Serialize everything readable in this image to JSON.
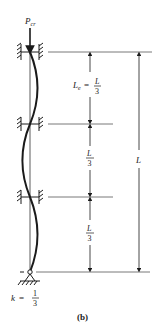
{
  "diagram": {
    "caption": "(b)",
    "load_label": "P",
    "load_subscript": "cr",
    "effective_length_label": {
      "symbol": "L",
      "subscript": "e",
      "equals": "=",
      "numerator": "L",
      "denominator": "3"
    },
    "segment_labels": [
      {
        "numerator": "L",
        "denominator": "3"
      },
      {
        "numerator": "L",
        "denominator": "3"
      }
    ],
    "total_length_label": "L",
    "k_label": {
      "symbol": "k",
      "equals": "=",
      "numerator": "1",
      "denominator": "3"
    },
    "colors": {
      "line": "#1a1a1a",
      "thin_line": "#555555",
      "background": "#ffffff"
    }
  }
}
